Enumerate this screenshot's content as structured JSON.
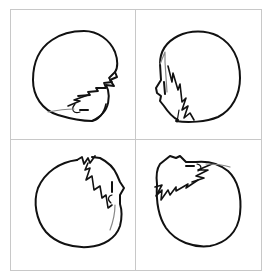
{
  "figure": {
    "description": "2x2 grid of line-drawn chibi head sketches in four rotations",
    "colors": {
      "background": "#ffffff",
      "grid_line": "#c8c8c8",
      "ink": "#111111",
      "light_ink": "#888888"
    },
    "grid": {
      "left": 10,
      "top": 9,
      "right": 261,
      "bottom": 270,
      "mid_x": 135,
      "mid_y": 139
    },
    "panels": [
      {
        "id": "top-left",
        "label": "head rotated 90 degrees clockwise, face at bottom right"
      },
      {
        "id": "top-right",
        "label": "head in profile facing left"
      },
      {
        "id": "bottom-left",
        "label": "head rotated, face at upper right"
      },
      {
        "id": "bottom-right",
        "label": "head upside down, face at upper left"
      }
    ]
  }
}
